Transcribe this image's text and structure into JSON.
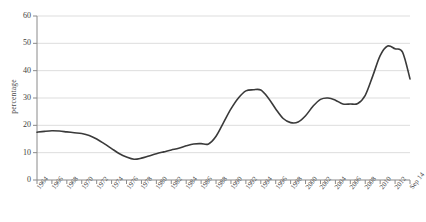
{
  "chart_data": {
    "type": "line",
    "title": "",
    "xlabel": "",
    "ylabel": "percentage",
    "ylim": [
      0,
      60
    ],
    "yticks": [
      0,
      10,
      20,
      30,
      40,
      50,
      60
    ],
    "grid": true,
    "legend": "none",
    "x_tick_labels": [
      "1964",
      "1966",
      "1968",
      "1970",
      "1972",
      "1974",
      "1976",
      "1978",
      "1980",
      "1982",
      "1984",
      "1986",
      "1988",
      "1990",
      "1992",
      "1994",
      "1996",
      "1998",
      "2000",
      "2002",
      "2004",
      "2006",
      "2008",
      "2010",
      "2012",
      "Sep 14"
    ],
    "line_color": "#3a3a3a",
    "grid_color": "#d9d9d9",
    "axis_color": "#8a8a8a",
    "x": [
      "1964",
      "1965",
      "1966",
      "1967",
      "1968",
      "1969",
      "1970",
      "1971",
      "1972",
      "1973",
      "1974",
      "1975",
      "1976",
      "1977",
      "1978",
      "1979",
      "1980",
      "1981",
      "1982",
      "1983",
      "1984",
      "1985",
      "1986",
      "1987",
      "1988",
      "1989",
      "1990",
      "1991",
      "1992",
      "1993",
      "1994",
      "1995",
      "1996",
      "1997",
      "1998",
      "1999",
      "2000",
      "2001",
      "2002",
      "2003",
      "2004",
      "2005",
      "2006",
      "2007",
      "2008",
      "2009",
      "2010",
      "2011",
      "2012",
      "2013",
      "Sep 14"
    ],
    "values": [
      17.5,
      17.8,
      18.0,
      17.9,
      17.6,
      17.3,
      17.0,
      16.3,
      15.0,
      13.3,
      11.5,
      9.7,
      8.4,
      7.6,
      8.0,
      8.8,
      9.6,
      10.3,
      11.0,
      11.6,
      12.5,
      13.2,
      13.3,
      13.2,
      16.0,
      21.0,
      26.0,
      30.0,
      32.6,
      33.0,
      32.9,
      30.0,
      26.0,
      22.5,
      21.0,
      21.2,
      23.5,
      27.0,
      29.5,
      30.0,
      29.2,
      27.8,
      27.8,
      28.0,
      31.0,
      38.0,
      45.5,
      49.0,
      48.0,
      46.8,
      37.0
    ]
  }
}
